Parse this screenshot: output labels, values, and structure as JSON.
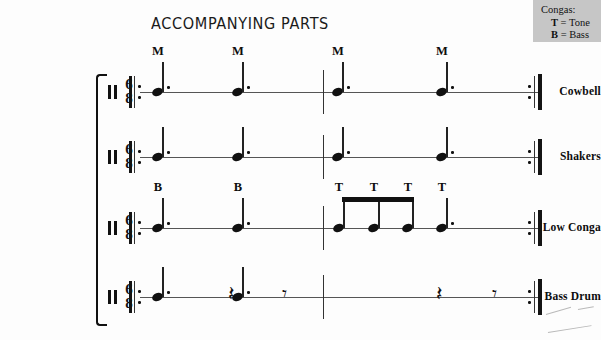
{
  "title": "ACCOMPANYING PARTS",
  "legend": {
    "heading": "Congas:",
    "rows": [
      {
        "symbol": "T",
        "equals": "=",
        "word": "Tone"
      },
      {
        "symbol": "B",
        "equals": "=",
        "word": "Bass"
      }
    ]
  },
  "score": {
    "time_signature": {
      "numerator": "6",
      "denominator": "8"
    },
    "measures": 2,
    "repeat_start": true,
    "repeat_end": true,
    "staves": [
      {
        "name": "Cowbell",
        "articulations": [
          "M",
          "M",
          "M",
          "M"
        ],
        "events": [
          {
            "type": "note",
            "value": "dotted-quarter"
          },
          {
            "type": "note",
            "value": "dotted-quarter"
          },
          {
            "type": "note",
            "value": "dotted-quarter"
          },
          {
            "type": "note",
            "value": "dotted-quarter"
          }
        ]
      },
      {
        "name": "Shakers",
        "articulations": [],
        "events": [
          {
            "type": "note",
            "value": "dotted-quarter"
          },
          {
            "type": "note",
            "value": "dotted-quarter"
          },
          {
            "type": "note",
            "value": "dotted-quarter"
          },
          {
            "type": "note",
            "value": "dotted-quarter"
          }
        ]
      },
      {
        "name": "Low Conga",
        "articulations": [
          "B",
          "B",
          "T",
          "T",
          "T",
          "T"
        ],
        "events": [
          {
            "type": "note",
            "value": "dotted-quarter"
          },
          {
            "type": "note",
            "value": "dotted-quarter"
          },
          {
            "type": "note",
            "value": "eighth-beamed"
          },
          {
            "type": "note",
            "value": "eighth-beamed"
          },
          {
            "type": "note",
            "value": "eighth-beamed"
          },
          {
            "type": "note",
            "value": "dotted-quarter"
          }
        ]
      },
      {
        "name": "Bass Drum",
        "articulations": [],
        "events": [
          {
            "type": "note",
            "value": "dotted-quarter"
          },
          {
            "type": "rest",
            "value": "quarter"
          },
          {
            "type": "rest",
            "value": "eighth"
          },
          {
            "type": "note",
            "value": "dotted-quarter"
          },
          {
            "type": "rest",
            "value": "quarter"
          },
          {
            "type": "rest",
            "value": "eighth"
          }
        ]
      }
    ]
  },
  "glyphs": {
    "quarter_rest": "𝄽",
    "eighth_rest": "𝄾"
  }
}
